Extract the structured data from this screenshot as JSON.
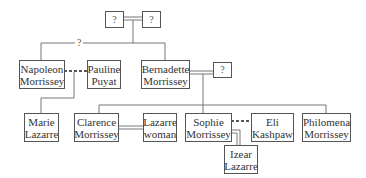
{
  "diagram": {
    "type": "family-tree",
    "unknown_label": "?",
    "line_color": "#777777",
    "box_border_color": "#555555",
    "nodes": {
      "unknown_grandparent_1": {
        "lines": [
          "?"
        ]
      },
      "unknown_grandparent_2": {
        "lines": [
          "?"
        ]
      },
      "napoleon": {
        "lines": [
          "Napoleon",
          "Morrissey"
        ]
      },
      "pauline": {
        "lines": [
          "Pauline",
          "Puyat"
        ]
      },
      "bernadette": {
        "lines": [
          "Bernadette",
          "Morrissey"
        ]
      },
      "bernadette_spouse": {
        "lines": [
          "?"
        ]
      },
      "marie": {
        "lines": [
          "Marie",
          "Lazarre"
        ]
      },
      "clarence": {
        "lines": [
          "Clarence",
          "Morrissey"
        ]
      },
      "lazarre_woman": {
        "lines": [
          "Lazarre",
          "woman"
        ]
      },
      "sophie": {
        "lines": [
          "Sophie",
          "Morrissey"
        ]
      },
      "eli": {
        "lines": [
          "Eli",
          "Kashpaw"
        ]
      },
      "philomena": {
        "lines": [
          "Philomena",
          "Morrissey"
        ]
      },
      "izear": {
        "lines": [
          "Izear",
          "Lazarre"
        ]
      }
    },
    "sibling_link_label": "?",
    "relationships": [
      {
        "type": "marriage",
        "from": "unknown_grandparent_1",
        "to": "unknown_grandparent_2"
      },
      {
        "type": "uncertain-sibling",
        "label": "?",
        "members": [
          "napoleon",
          "bernadette"
        ]
      },
      {
        "type": "affair",
        "style": "dashed",
        "from": "napoleon",
        "to": "pauline",
        "child": "marie"
      },
      {
        "type": "marriage",
        "from": "bernadette",
        "to": "bernadette_spouse",
        "children": [
          "clarence",
          "sophie",
          "philomena"
        ]
      },
      {
        "type": "marriage",
        "from": "clarence",
        "to": "lazarre_woman"
      },
      {
        "type": "affair",
        "style": "dashed",
        "from": "sophie",
        "to": "eli"
      },
      {
        "type": "marriage",
        "from": "sophie",
        "to": "izear"
      }
    ]
  }
}
